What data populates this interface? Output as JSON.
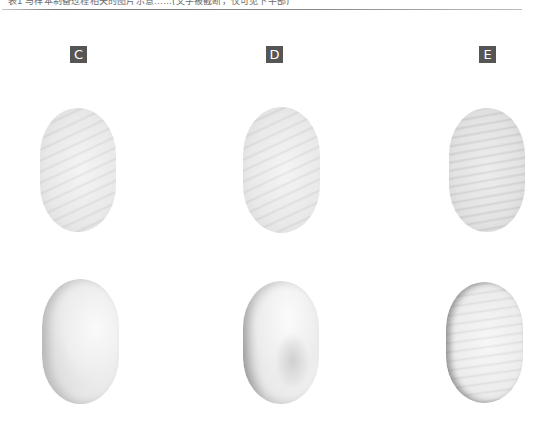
{
  "header": {
    "caption_text": "表1 与样本制备过程相关的图片示意……(文字被截断，仅可见下半部)",
    "caption_visible": "partial (top clipped)"
  },
  "figure": {
    "panels": [
      {
        "label": "C",
        "images": [
          {
            "position": "top",
            "description": "smooth oval tablet with diagonal stripe texture"
          },
          {
            "position": "bottom",
            "description": "oval tablet with rough, puffy textured surface"
          }
        ]
      },
      {
        "label": "D",
        "images": [
          {
            "position": "top",
            "description": "smooth oval tablet with faint diagonal stripes"
          },
          {
            "position": "bottom",
            "description": "oval tablet with uneven, cracked puffy surface"
          }
        ]
      },
      {
        "label": "E",
        "images": [
          {
            "position": "top",
            "description": "oval tablet with horizontal wavy stripe texture"
          },
          {
            "position": "bottom",
            "description": "oval tablet with wavy textured puffy surface"
          }
        ]
      }
    ]
  },
  "colors": {
    "label_bg": "#555555",
    "label_text": "#ffffff",
    "rule": "#7a7a7a"
  }
}
